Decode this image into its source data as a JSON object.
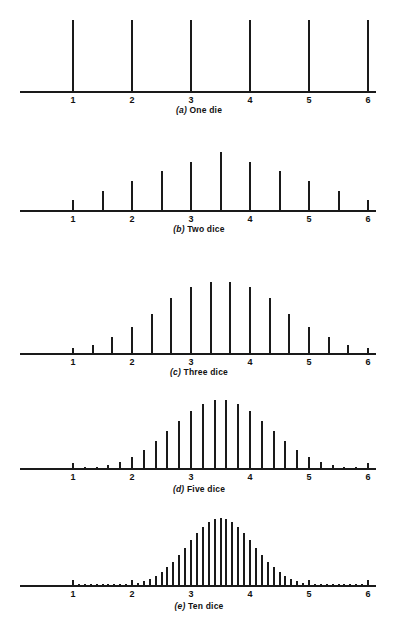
{
  "figure": {
    "axis": {
      "tick_values": [
        1,
        2,
        3,
        4,
        5,
        6
      ],
      "tick_labels": [
        "1",
        "2",
        "3",
        "4",
        "5",
        "6"
      ],
      "xmin": 1,
      "xmax": 6
    }
  },
  "chart_data": {
    "type": "bar",
    "xlabel": "",
    "ylabel": "",
    "xlim": [
      1,
      6
    ],
    "grid": false,
    "legend": "none",
    "panels": [
      {
        "id": "a",
        "label": "(a)",
        "caption": "One die",
        "n_dice": 1,
        "step": 1,
        "x": [
          1,
          2,
          3,
          4,
          5,
          6
        ],
        "values": [
          1,
          1,
          1,
          1,
          1,
          1
        ],
        "max_value": 1
      },
      {
        "id": "b",
        "label": "(b)",
        "caption": "Two dice",
        "n_dice": 2,
        "step": 0.5,
        "x": [
          1,
          1.5,
          2,
          2.5,
          3,
          3.5,
          4,
          4.5,
          5,
          5.5,
          6
        ],
        "values": [
          1,
          2,
          3,
          4,
          5,
          6,
          5,
          4,
          3,
          2,
          1
        ],
        "max_value": 6
      },
      {
        "id": "c",
        "label": "(c)",
        "caption": "Three dice",
        "n_dice": 3,
        "step": 0.3333333333,
        "x": [
          1,
          1.3333,
          1.6667,
          2,
          2.3333,
          2.6667,
          3,
          3.3333,
          3.6667,
          4,
          4.3333,
          4.6667,
          5,
          5.3333,
          5.6667,
          6
        ],
        "values": [
          1,
          3,
          6,
          10,
          15,
          21,
          25,
          27,
          27,
          25,
          21,
          15,
          10,
          6,
          3,
          1
        ],
        "max_value": 27
      },
      {
        "id": "d",
        "label": "(d)",
        "caption": "Five dice",
        "n_dice": 5,
        "step": 0.2,
        "x": [
          1,
          1.2,
          1.4,
          1.6,
          1.8,
          2,
          2.2,
          2.4,
          2.6,
          2.8,
          3,
          3.2,
          3.4,
          3.6,
          3.8,
          4,
          4.2,
          4.4,
          4.6,
          4.8,
          5,
          5.2,
          5.4,
          5.6,
          5.8,
          6
        ],
        "values": [
          1,
          5,
          15,
          35,
          70,
          126,
          205,
          305,
          420,
          540,
          651,
          735,
          780,
          780,
          735,
          651,
          540,
          420,
          305,
          205,
          126,
          70,
          35,
          15,
          5,
          1
        ],
        "max_value": 780
      },
      {
        "id": "e",
        "label": "(e)",
        "caption": "Ten dice",
        "n_dice": 10,
        "step": 0.1,
        "x": [
          1,
          1.1,
          1.2,
          1.3,
          1.4,
          1.5,
          1.6,
          1.7,
          1.8,
          1.9,
          2,
          2.1,
          2.2,
          2.3,
          2.4,
          2.5,
          2.6,
          2.7,
          2.8,
          2.9,
          3,
          3.1,
          3.2,
          3.3,
          3.4,
          3.5,
          3.6,
          3.7,
          3.8,
          3.9,
          4,
          4.1,
          4.2,
          4.3,
          4.4,
          4.5,
          4.6,
          4.7,
          4.8,
          4.9,
          5,
          5.1,
          5.2,
          5.3,
          5.4,
          5.5,
          5.6,
          5.7,
          5.8,
          5.9,
          6
        ],
        "values": [
          1,
          10,
          55,
          220,
          715,
          2002,
          4995,
          11340,
          23760,
          46420,
          85228,
          147940,
          243925,
          383470,
          576565,
          831204,
          1151370,
          1535040,
          1972630,
          2446300,
          2930455,
          3393610,
          3801535,
          4121260,
          4325310,
          4395456,
          4325310,
          4121260,
          3801535,
          3393610,
          2930455,
          2446300,
          1972630,
          1535040,
          1151370,
          831204,
          576565,
          383470,
          243925,
          147940,
          85228,
          46420,
          23760,
          11340,
          4995,
          2002,
          715,
          220,
          55,
          10,
          1
        ],
        "max_value": 4395456
      }
    ]
  },
  "layout": {
    "axis_left_px": 20,
    "axis_right_px": 376,
    "x1_px": 73,
    "x6_px": 368,
    "panels_geom": [
      {
        "id": "a",
        "baseline_y": 91,
        "max_h": 71,
        "caption_y": 105
      },
      {
        "id": "b",
        "baseline_y": 210,
        "max_h": 58,
        "caption_y": 224
      },
      {
        "id": "c",
        "baseline_y": 353,
        "max_h": 71,
        "caption_y": 367
      },
      {
        "id": "d",
        "baseline_y": 468,
        "max_h": 68,
        "caption_y": 484
      },
      {
        "id": "e",
        "baseline_y": 585,
        "max_h": 67,
        "caption_y": 601
      }
    ],
    "colors": {
      "ink": "#1a1a1a",
      "background": "#ffffff"
    }
  }
}
